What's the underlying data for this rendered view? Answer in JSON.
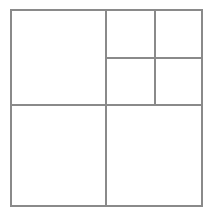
{
  "document": {
    "title": "Rectangle Partition Diagram",
    "background_color": "#ffffff",
    "width": 212,
    "height": 216
  },
  "style": {
    "line_color": "#8a8a8a",
    "fill_color": "#ffffff",
    "line_width": 1.1
  },
  "diagram": {
    "type": "rectangle-subdivision",
    "outer_frame": {
      "x": 11,
      "y": 10,
      "width": 191,
      "height": 196
    },
    "labels": [],
    "annotations": [],
    "regions": [
      {
        "id": "top-left-large",
        "x": 11,
        "y": 10,
        "width": 95,
        "height": 95,
        "label": ""
      },
      {
        "id": "top-mid-upper",
        "x": 106,
        "y": 10,
        "width": 49,
        "height": 48,
        "label": ""
      },
      {
        "id": "top-right-upper",
        "x": 155,
        "y": 10,
        "width": 47,
        "height": 48,
        "label": ""
      },
      {
        "id": "mid-center",
        "x": 106,
        "y": 58,
        "width": 49,
        "height": 47,
        "label": ""
      },
      {
        "id": "mid-right",
        "x": 155,
        "y": 58,
        "width": 47,
        "height": 47,
        "label": ""
      },
      {
        "id": "bottom-left",
        "x": 11,
        "y": 105,
        "width": 95,
        "height": 101,
        "label": ""
      },
      {
        "id": "bottom-right",
        "x": 106,
        "y": 105,
        "width": 96,
        "height": 101,
        "label": ""
      }
    ],
    "dividers": [
      {
        "id": "horizontal-main",
        "orientation": "horizontal",
        "x1": 11,
        "y1": 105,
        "x2": 202,
        "y2": 105
      },
      {
        "id": "vertical-main",
        "orientation": "vertical",
        "x1": 106,
        "y1": 10,
        "x2": 106,
        "y2": 206
      },
      {
        "id": "vertical-upper-right",
        "orientation": "vertical",
        "x1": 155,
        "y1": 10,
        "x2": 155,
        "y2": 105
      },
      {
        "id": "horizontal-upper-right",
        "orientation": "horizontal",
        "x1": 106,
        "y1": 58,
        "x2": 202,
        "y2": 58
      }
    ]
  }
}
